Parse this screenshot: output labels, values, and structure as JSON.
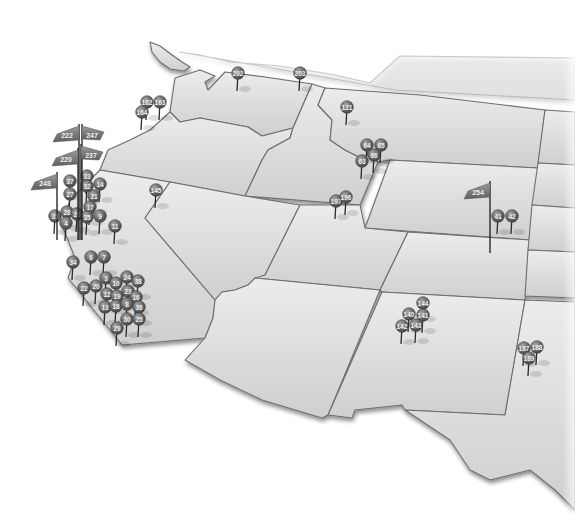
{
  "map": {
    "type": "pin-map",
    "region": "Western United States",
    "colors": {
      "state_fill_light": "#e6e6e6",
      "state_fill_dark": "#c9c9c9",
      "state_border": "#6d6d6d",
      "pin_head": "#6a6a6a",
      "pin_label": "#f0f0f0",
      "background": "#ffffff"
    },
    "pins": [
      {
        "label": "202",
        "x": 238,
        "y": 73
      },
      {
        "label": "203",
        "x": 300,
        "y": 73
      },
      {
        "label": "162",
        "x": 147,
        "y": 102
      },
      {
        "label": "163",
        "x": 160,
        "y": 102
      },
      {
        "label": "164",
        "x": 142,
        "y": 112
      },
      {
        "label": "121",
        "x": 347,
        "y": 107
      },
      {
        "label": "64",
        "x": 367,
        "y": 145
      },
      {
        "label": "65",
        "x": 381,
        "y": 145
      },
      {
        "label": "66",
        "x": 374,
        "y": 155
      },
      {
        "label": "63",
        "x": 362,
        "y": 161
      },
      {
        "label": "145",
        "x": 156,
        "y": 190
      },
      {
        "label": "197",
        "x": 336,
        "y": 201
      },
      {
        "label": "196",
        "x": 346,
        "y": 197
      },
      {
        "label": "41",
        "x": 498,
        "y": 216
      },
      {
        "label": "42",
        "x": 512,
        "y": 216
      },
      {
        "label": "33",
        "x": 87,
        "y": 176
      },
      {
        "label": "37",
        "x": 70,
        "y": 181
      },
      {
        "label": "32",
        "x": 87,
        "y": 186
      },
      {
        "label": "14",
        "x": 100,
        "y": 184
      },
      {
        "label": "27",
        "x": 70,
        "y": 194
      },
      {
        "label": "21",
        "x": 94,
        "y": 196
      },
      {
        "label": "17",
        "x": 90,
        "y": 207
      },
      {
        "label": "28",
        "x": 67,
        "y": 212
      },
      {
        "label": "26",
        "x": 77,
        "y": 214
      },
      {
        "label": "31",
        "x": 55,
        "y": 216
      },
      {
        "label": "35",
        "x": 87,
        "y": 217
      },
      {
        "label": "9",
        "x": 100,
        "y": 216
      },
      {
        "label": "4",
        "x": 66,
        "y": 223
      },
      {
        "label": "11",
        "x": 115,
        "y": 226
      },
      {
        "label": "34",
        "x": 73,
        "y": 262
      },
      {
        "label": "6",
        "x": 91,
        "y": 257
      },
      {
        "label": "7",
        "x": 104,
        "y": 257
      },
      {
        "label": "3",
        "x": 106,
        "y": 278
      },
      {
        "label": "22",
        "x": 84,
        "y": 288
      },
      {
        "label": "20",
        "x": 96,
        "y": 286
      },
      {
        "label": "10",
        "x": 116,
        "y": 283
      },
      {
        "label": "24",
        "x": 127,
        "y": 277
      },
      {
        "label": "38",
        "x": 138,
        "y": 281
      },
      {
        "label": "12",
        "x": 107,
        "y": 294
      },
      {
        "label": "19",
        "x": 117,
        "y": 296
      },
      {
        "label": "23",
        "x": 128,
        "y": 291
      },
      {
        "label": "16",
        "x": 136,
        "y": 297
      },
      {
        "label": "13",
        "x": 105,
        "y": 307
      },
      {
        "label": "18",
        "x": 116,
        "y": 306
      },
      {
        "label": "8",
        "x": 127,
        "y": 304
      },
      {
        "label": "36",
        "x": 139,
        "y": 307
      },
      {
        "label": "30",
        "x": 127,
        "y": 319
      },
      {
        "label": "25",
        "x": 139,
        "y": 319
      },
      {
        "label": "29",
        "x": 117,
        "y": 328
      },
      {
        "label": "144",
        "x": 423,
        "y": 303
      },
      {
        "label": "140",
        "x": 409,
        "y": 314
      },
      {
        "label": "141",
        "x": 423,
        "y": 315
      },
      {
        "label": "142",
        "x": 402,
        "y": 326
      },
      {
        "label": "143",
        "x": 416,
        "y": 325
      },
      {
        "label": "187",
        "x": 524,
        "y": 348
      },
      {
        "label": "188",
        "x": 537,
        "y": 347
      },
      {
        "label": "189",
        "x": 529,
        "y": 358
      }
    ],
    "flags": [
      {
        "label": "222",
        "pole_x": 79,
        "top_y": 126
      },
      {
        "label": "247",
        "pole_x": 82,
        "top_y": 126
      },
      {
        "label": "220",
        "pole_x": 78,
        "top_y": 150
      },
      {
        "label": "237",
        "pole_x": 81,
        "top_y": 146
      },
      {
        "label": "248",
        "pole_x": 57,
        "top_y": 174
      },
      {
        "label": "254",
        "pole_x": 490,
        "top_y": 183
      }
    ]
  }
}
